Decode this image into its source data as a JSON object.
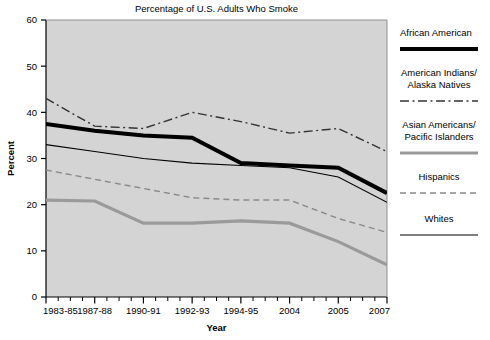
{
  "chart_data": {
    "type": "line",
    "title": "Percentage of U.S. Adults Who Smoke",
    "xlabel": "Year",
    "ylabel": "Percent",
    "ylim": [
      0,
      60
    ],
    "yticks": [
      0,
      10,
      20,
      30,
      40,
      50,
      60
    ],
    "grid": false,
    "legend_position": "right",
    "plot_background": "#d4d4d4",
    "categories": [
      "1983-85",
      "1987-88",
      "1990-91",
      "1992-93",
      "1994-95",
      "2004",
      "2005",
      "2007"
    ],
    "x_tick_labels": [
      "1983-85",
      "1987-88",
      "1990-91",
      "1992-93",
      "1994-95",
      "2004",
      "2005",
      "2007"
    ],
    "series": [
      {
        "name": "African American",
        "color": "#000000",
        "style": "solid",
        "width": 4,
        "values": [
          37.5,
          36.0,
          35.0,
          34.5,
          29.0,
          28.5,
          28.0,
          22.5
        ]
      },
      {
        "name": "American Indians/ Alaska Natives",
        "color": "#333333",
        "style": "dash-dot",
        "width": 1.4,
        "values": [
          43.0,
          37.0,
          36.5,
          40.0,
          38.0,
          35.5,
          36.5,
          31.5
        ]
      },
      {
        "name": "Asian Americans/ Pacific Islanders",
        "color": "#9a9a9a",
        "style": "solid",
        "width": 3.2,
        "values": [
          21.0,
          20.8,
          16.0,
          16.0,
          16.5,
          16.0,
          12.0,
          7.0
        ]
      },
      {
        "name": "Hispanics",
        "color": "#8a8a8a",
        "style": "dashed",
        "width": 1.4,
        "values": [
          27.5,
          25.5,
          23.5,
          21.5,
          21.0,
          21.0,
          17.0,
          14.0
        ]
      },
      {
        "name": "Whites",
        "color": "#000000",
        "style": "solid",
        "width": 1.1,
        "values": [
          33.0,
          31.5,
          30.0,
          29.0,
          28.5,
          28.0,
          26.0,
          20.5
        ]
      }
    ]
  },
  "legend": {
    "items": [
      {
        "label": "African American",
        "key": "african-american"
      },
      {
        "label_line1": "American Indians/",
        "label_line2": "Alaska Natives",
        "key": "american-indians"
      },
      {
        "label_line1": "Asian Americans/",
        "label_line2": "Pacific Islanders",
        "key": "asian-americans"
      },
      {
        "label": "Hispanics",
        "key": "hispanics"
      },
      {
        "label": "Whites",
        "key": "whites"
      }
    ]
  }
}
